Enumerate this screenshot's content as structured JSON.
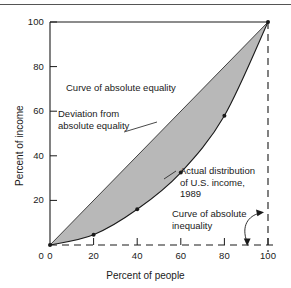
{
  "figure": {
    "background_color": "#ffffff",
    "shade_color": "#b8b8b8",
    "line_color": "#1a1a1a",
    "top_rule_color": "#555555"
  },
  "axes": {
    "x_title": "Percent of people",
    "y_title": "Percent of income",
    "x_ticks": [
      "0",
      "20",
      "40",
      "60",
      "80",
      "100"
    ],
    "y_ticks": [
      "0",
      "20",
      "40",
      "60",
      "80",
      "100"
    ]
  },
  "annotations": {
    "equality": {
      "line1": "Curve of absolute equality"
    },
    "deviation": {
      "line1": "Deviation from",
      "line2": "absolute equality"
    },
    "actual": {
      "line1": "Actual distribution",
      "line2": "of U.S. income,",
      "line3": "1989"
    },
    "inequality": {
      "line1": "Curve of absolute",
      "line2": "inequality"
    }
  },
  "chart_data": {
    "type": "line",
    "xlabel": "Percent of people",
    "ylabel": "Percent of income",
    "xlim": [
      0,
      100
    ],
    "ylim": [
      0,
      100
    ],
    "xticks": [
      0,
      20,
      40,
      60,
      80,
      100
    ],
    "yticks": [
      0,
      20,
      40,
      60,
      80,
      100
    ],
    "grid": false,
    "legend": "none (in-plot text annotations)",
    "series": [
      {
        "name": "Curve of absolute equality",
        "style": "solid thin diagonal",
        "x": [
          0,
          100
        ],
        "values": [
          0,
          100
        ]
      },
      {
        "name": "Actual distribution of U.S. income, 1989",
        "style": "solid curve with point markers",
        "x": [
          0,
          20,
          40,
          60,
          80,
          100
        ],
        "values": [
          0,
          4.6,
          16.0,
          32.5,
          58.0,
          100
        ]
      },
      {
        "name": "Curve of absolute inequality",
        "style": "dashed along x-axis then up right edge",
        "x": [
          0,
          100,
          100
        ],
        "values": [
          0,
          0,
          100
        ]
      }
    ],
    "shaded_region": {
      "name": "Deviation from absolute equality",
      "between": [
        "Curve of absolute equality",
        "Actual distribution of U.S. income, 1989"
      ],
      "color": "#b8b8b8"
    },
    "annotations": [
      "Curve of absolute equality",
      "Deviation from absolute equality",
      "Actual distribution of U.S. income, 1989",
      "Curve of absolute inequality"
    ]
  }
}
